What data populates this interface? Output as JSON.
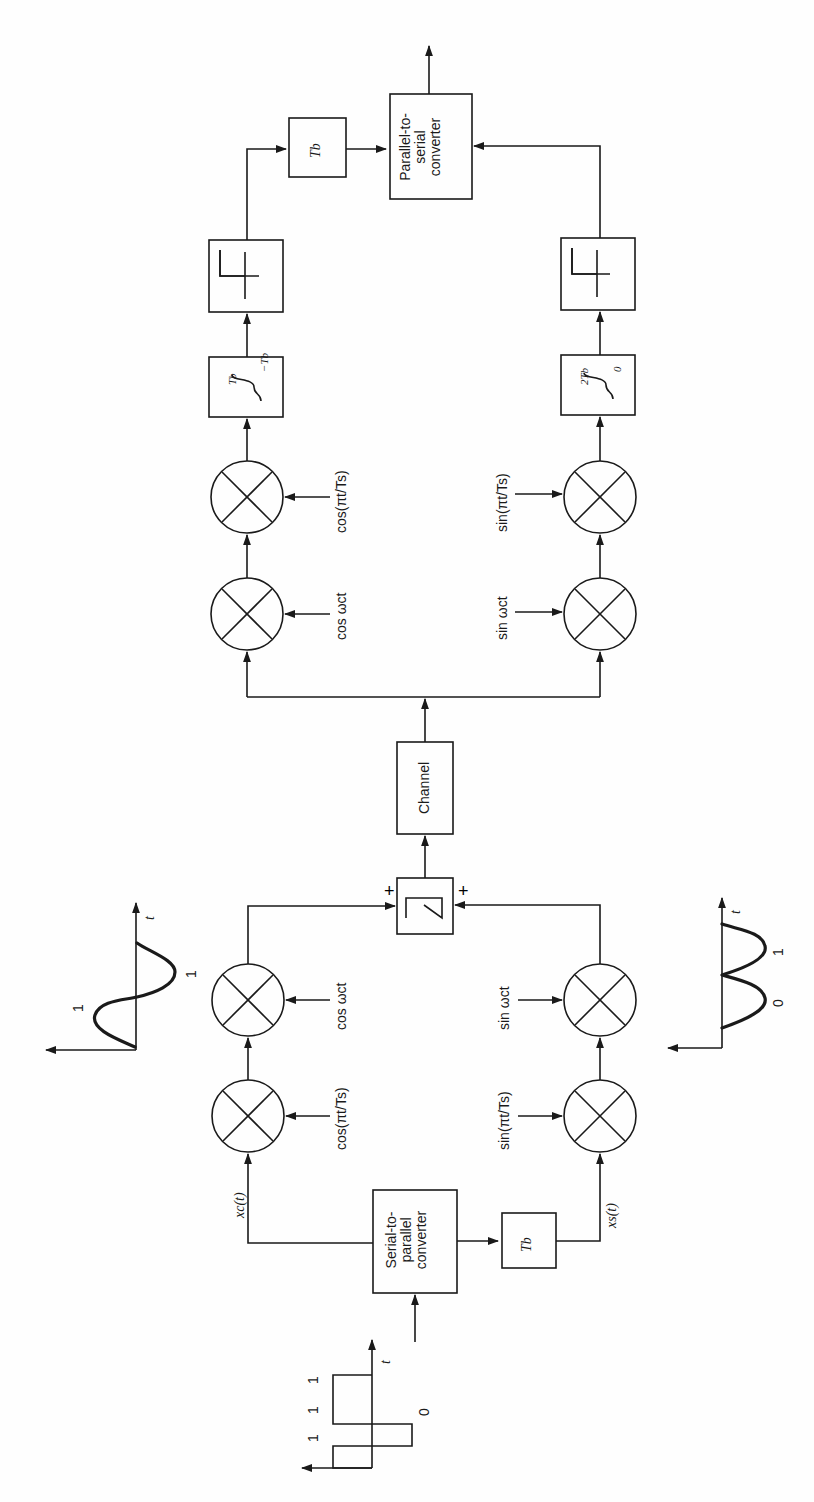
{
  "transmitter": {
    "input_waveform": {
      "bits": [
        "1",
        "0",
        "1",
        "1"
      ],
      "time_axis_label": "t"
    },
    "serial_to_parallel": "Serial-to-parallel converter",
    "delay_block": "Tb",
    "xc_label": "xc(t)",
    "xs_label": "xs(t)",
    "mixers": {
      "upper_1": "cos(πt/Ts)",
      "upper_2": "cos ωct",
      "lower_1": "sin(πt/Ts)",
      "lower_2": "sin ωct"
    },
    "upper_waveform": {
      "labels": [
        "1",
        "1"
      ],
      "time_axis_label": "t"
    },
    "lower_waveform": {
      "labels": [
        "0",
        "1"
      ],
      "time_axis_label": "t"
    },
    "summer": {
      "symbol": "Σ",
      "plus_upper": "+",
      "plus_lower": "+"
    }
  },
  "channel": "Channel",
  "receiver": {
    "mixers": {
      "upper_1": "cos ωct",
      "upper_2": "cos(πt/Ts)",
      "lower_1": "sin ωct",
      "lower_2": "sin(πt/Ts)"
    },
    "integrators": {
      "upper": {
        "upper_limit": "Tb",
        "lower_limit": "−Tb"
      },
      "lower": {
        "upper_limit": "2Tb",
        "lower_limit": "0"
      }
    },
    "decision_devices": [
      "threshold",
      "threshold"
    ],
    "delay_block": "Tb",
    "parallel_to_serial": "Parallel-to-serial converter"
  }
}
